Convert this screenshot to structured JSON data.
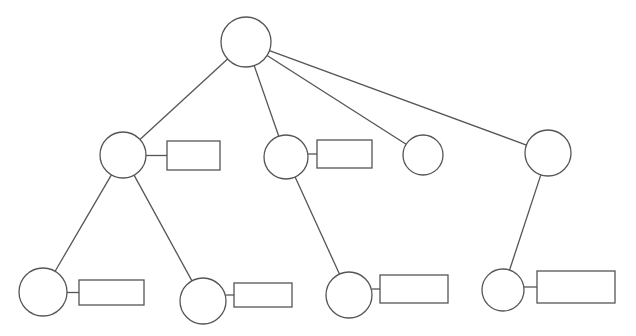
{
  "diagram": {
    "type": "tree",
    "nodes": [
      {
        "id": "root",
        "cx": 246,
        "cy": 42,
        "r": 25
      },
      {
        "id": "n1",
        "cx": 123,
        "cy": 155,
        "r": 23
      },
      {
        "id": "n2",
        "cx": 286,
        "cy": 157,
        "r": 22
      },
      {
        "id": "n3",
        "cx": 423,
        "cy": 155,
        "r": 20
      },
      {
        "id": "n4",
        "cx": 548,
        "cy": 153,
        "r": 23
      },
      {
        "id": "n1a",
        "cx": 43,
        "cy": 292,
        "r": 24
      },
      {
        "id": "n1b",
        "cx": 203,
        "cy": 301,
        "r": 23
      },
      {
        "id": "n2a",
        "cx": 349,
        "cy": 295,
        "r": 23
      },
      {
        "id": "n4a",
        "cx": 503,
        "cy": 290,
        "r": 21
      }
    ],
    "edges": [
      {
        "from": "root",
        "to": "n1"
      },
      {
        "from": "root",
        "to": "n2"
      },
      {
        "from": "root",
        "to": "n3"
      },
      {
        "from": "root",
        "to": "n4"
      },
      {
        "from": "n1",
        "to": "n1a"
      },
      {
        "from": "n1",
        "to": "n1b"
      },
      {
        "from": "n2",
        "to": "n2a"
      },
      {
        "from": "n4",
        "to": "n4a"
      }
    ],
    "boxes": [
      {
        "node": "n1",
        "x": 167,
        "y": 141,
        "w": 53,
        "h": 29
      },
      {
        "node": "n2",
        "x": 317,
        "y": 140,
        "w": 55,
        "h": 28
      },
      {
        "node": "n1a",
        "x": 79,
        "y": 280,
        "w": 65,
        "h": 25
      },
      {
        "node": "n1b",
        "x": 234,
        "y": 283,
        "w": 58,
        "h": 24
      },
      {
        "node": "n2a",
        "x": 380,
        "y": 275,
        "w": 68,
        "h": 28
      },
      {
        "node": "n4a",
        "x": 537,
        "y": 271,
        "w": 78,
        "h": 32
      }
    ]
  }
}
